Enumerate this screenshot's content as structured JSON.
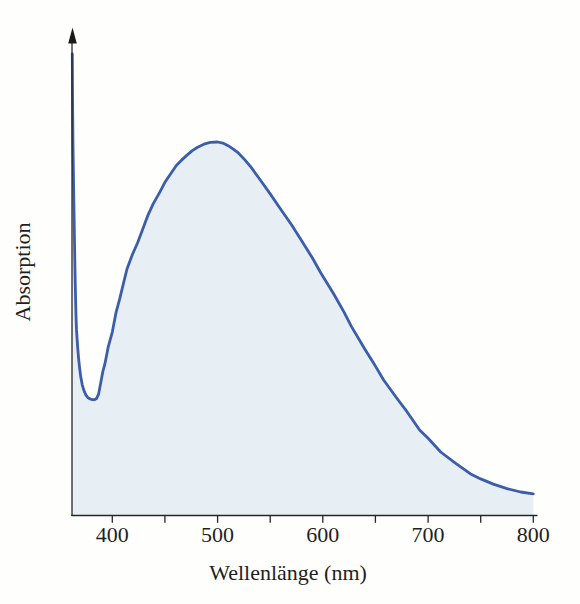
{
  "colors": {
    "curve": "#3b5dab",
    "fill": "#e7eff5",
    "axis": "#262626",
    "arrow": "#1a1a1a",
    "text": "#1f1f1f"
  },
  "chart_data": {
    "type": "area",
    "title": "",
    "xlabel": "Wellenlänge (nm)",
    "ylabel": "Absorption",
    "xlim": [
      362,
      800
    ],
    "ylim": [
      0,
      1.3
    ],
    "grid": false,
    "legend": "none",
    "y_axis_style": "unlabeled arrow axis (arbitrary units)",
    "x_ticks": [
      400,
      450,
      500,
      550,
      600,
      650,
      700,
      750,
      800
    ],
    "x_tick_labels": [
      "400",
      "500",
      "600",
      "700",
      "800"
    ],
    "x_tick_label_positions": [
      400,
      500,
      600,
      700,
      800
    ],
    "peak_nm": 500,
    "minimum_nm": 383,
    "series": [
      {
        "name": "Absorption",
        "units": "relative absorption (peak = 1.0)",
        "points": [
          [
            362,
            1.236
          ],
          [
            362.3,
            1.1
          ],
          [
            362.7,
            0.99
          ],
          [
            363,
            0.92
          ],
          [
            363.5,
            0.83
          ],
          [
            364,
            0.75
          ],
          [
            364.5,
            0.67
          ],
          [
            365,
            0.59
          ],
          [
            365.5,
            0.535
          ],
          [
            366,
            0.497
          ],
          [
            367,
            0.453
          ],
          [
            368,
            0.42
          ],
          [
            369,
            0.393
          ],
          [
            370,
            0.372
          ],
          [
            371.5,
            0.349
          ],
          [
            373,
            0.335
          ],
          [
            375,
            0.322
          ],
          [
            377,
            0.315
          ],
          [
            379,
            0.312
          ],
          [
            381,
            0.31
          ],
          [
            383,
            0.31
          ],
          [
            385,
            0.313
          ],
          [
            387,
            0.325
          ],
          [
            389,
            0.355
          ],
          [
            391,
            0.385
          ],
          [
            393,
            0.406
          ],
          [
            396,
            0.45
          ],
          [
            400,
            0.491
          ],
          [
            403.5,
            0.543
          ],
          [
            407,
            0.58
          ],
          [
            410.5,
            0.621
          ],
          [
            414,
            0.66
          ],
          [
            419,
            0.698
          ],
          [
            424,
            0.73
          ],
          [
            430,
            0.775
          ],
          [
            434,
            0.805
          ],
          [
            439,
            0.835
          ],
          [
            445,
            0.865
          ],
          [
            450,
            0.892
          ],
          [
            456,
            0.917
          ],
          [
            461,
            0.938
          ],
          [
            466,
            0.952
          ],
          [
            471,
            0.965
          ],
          [
            476,
            0.977
          ],
          [
            481,
            0.986
          ],
          [
            487,
            0.994
          ],
          [
            493,
            0.999
          ],
          [
            500,
            1.0
          ],
          [
            505,
            0.997
          ],
          [
            510,
            0.99
          ],
          [
            515,
            0.981
          ],
          [
            520,
            0.97
          ],
          [
            526,
            0.952
          ],
          [
            532,
            0.932
          ],
          [
            540,
            0.901
          ],
          [
            550,
            0.861
          ],
          [
            560,
            0.82
          ],
          [
            570,
            0.78
          ],
          [
            580,
            0.735
          ],
          [
            590,
            0.69
          ],
          [
            598,
            0.65
          ],
          [
            610,
            0.595
          ],
          [
            620,
            0.545
          ],
          [
            627,
            0.507
          ],
          [
            640,
            0.445
          ],
          [
            650,
            0.4
          ],
          [
            658,
            0.362
          ],
          [
            670,
            0.315
          ],
          [
            680,
            0.278
          ],
          [
            692,
            0.229
          ],
          [
            700,
            0.207
          ],
          [
            712,
            0.17
          ],
          [
            726,
            0.14
          ],
          [
            740,
            0.112
          ],
          [
            750,
            0.098
          ],
          [
            762,
            0.084
          ],
          [
            775,
            0.072
          ],
          [
            788,
            0.063
          ],
          [
            800,
            0.058
          ]
        ]
      }
    ]
  }
}
